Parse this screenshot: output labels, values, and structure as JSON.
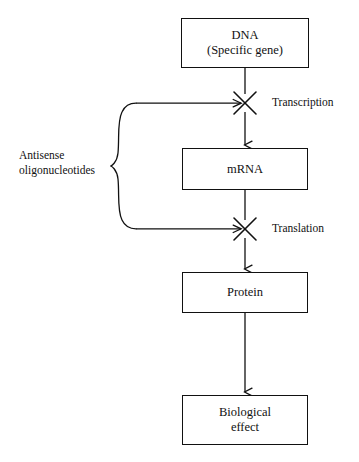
{
  "diagram": {
    "background_color": "#ffffff",
    "line_color": "#111111",
    "nodes": [
      {
        "id": "dna",
        "label": "DNA\n(Specific gene)",
        "x": 181,
        "y": 18,
        "width": 128,
        "height": 50
      },
      {
        "id": "mrna",
        "label": "mRNA",
        "x": 182,
        "y": 148,
        "width": 126,
        "height": 42
      },
      {
        "id": "protein",
        "label": "Protein",
        "x": 182,
        "y": 272,
        "width": 126,
        "height": 41
      },
      {
        "id": "biological-effect",
        "label": "Biological\neffect",
        "x": 182,
        "y": 395,
        "width": 126,
        "height": 50
      }
    ],
    "process_labels": [
      {
        "id": "transcription",
        "text": "Transcription",
        "x": 272,
        "y": 96
      },
      {
        "id": "translation",
        "text": "Translation",
        "x": 272,
        "y": 222
      }
    ],
    "blocked_steps": [
      {
        "id": "transcription-block",
        "marker": "x-cross",
        "cx": 245,
        "cy": 103,
        "blocks": "transcription"
      },
      {
        "id": "translation-block",
        "marker": "x-cross",
        "cx": 245,
        "cy": 229,
        "blocks": "translation"
      }
    ],
    "inhibitor": {
      "id": "antisense-oligonucleotides",
      "label": "Antisense\noligonucleotides",
      "label_x": 19,
      "label_y": 148,
      "brace_tip_x": 111,
      "brace_top_y": 103,
      "brace_bottom_y": 229,
      "brace_mid_y": 166
    },
    "flow_arrows": [
      {
        "id": "dna-to-transcription",
        "from": "dna",
        "to": "transcription-block"
      },
      {
        "id": "transcription-to-mrna",
        "from": "transcription-block",
        "to": "mrna"
      },
      {
        "id": "mrna-to-translation",
        "from": "mrna",
        "to": "translation-block"
      },
      {
        "id": "translation-to-protein",
        "from": "translation-block",
        "to": "protein"
      },
      {
        "id": "protein-to-effect",
        "from": "protein",
        "to": "biological-effect"
      }
    ]
  }
}
